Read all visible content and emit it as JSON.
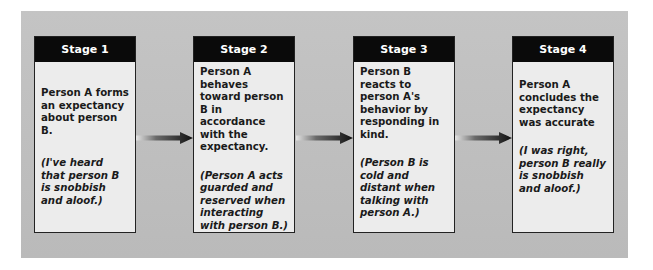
{
  "diagram": {
    "type": "flow",
    "direction": "left-to-right",
    "stages": [
      {
        "title": "Stage 1",
        "statement": "Person A forms an expectancy about person B.",
        "example": "(I've heard that person B is snobbish and aloof.)"
      },
      {
        "title": "Stage 2",
        "statement": "Person A behaves toward person B in accordance with the expectancy.",
        "example": "(Person A acts guarded and reserved when interacting with person B.)"
      },
      {
        "title": "Stage 3",
        "statement": "Person B reacts to person A's behavior by responding in kind.",
        "example": "(Person B is cold and distant when talking with person A.)"
      },
      {
        "title": "Stage 4",
        "statement": "Person A concludes the expectancy was accurate",
        "example": "(I was right, person B really is snobbish and aloof.)"
      }
    ],
    "arrows": [
      {
        "from": "Stage 1",
        "to": "Stage 2",
        "icon": "gradient-right-arrow-icon"
      },
      {
        "from": "Stage 2",
        "to": "Stage 3",
        "icon": "gradient-right-arrow-icon"
      },
      {
        "from": "Stage 3",
        "to": "Stage 4",
        "icon": "gradient-right-arrow-icon"
      }
    ],
    "colors": {
      "panel_background": "#bdbdbd",
      "header_background": "#0a0a0a",
      "header_text": "#ffffff",
      "box_background": "#ececec",
      "body_text": "#1a1a1a"
    }
  }
}
